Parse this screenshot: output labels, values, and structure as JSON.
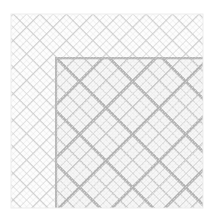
{
  "figure": {
    "title": "Recursive diagonal plaid pattern",
    "canvas_width": 215,
    "canvas_height": 219,
    "background_color": "#ffffff"
  },
  "chart_data": {
    "type": "heatmap",
    "title": "Recursive diagonal plaid pattern",
    "subtitle": "Self-similar 45-degree crosshatch with darker lower-right quadrant",
    "xlabel": "",
    "ylabel": "",
    "grid": false,
    "legend": "none",
    "plot_area": {
      "x": 11,
      "y": 14,
      "width": 192,
      "height": 194
    },
    "xlim": [
      11,
      203
    ],
    "ylim": [
      14,
      208
    ],
    "palette": {
      "background": "#ffffff",
      "base_fill": "#fdfdfd",
      "level1_line": "#9a9a9a",
      "level2_line": "#b4b4b4",
      "level3_line": "#c8c8c8",
      "level4_line": "#dcdcdc",
      "quadrant_tint": "#e2e2e2",
      "quadrant_border": "#b8b8b8",
      "band_color": "#b0b0b0"
    },
    "levels": [
      {
        "name": "level-1",
        "spacing": 37.5,
        "line_width": 5.4,
        "color": "#b0b0b0",
        "opacity": 0.95,
        "scope": "dark-quadrant"
      },
      {
        "name": "level-2",
        "spacing": 18.75,
        "line_width": 2.4,
        "color": "#bdbdbd",
        "opacity": 0.85,
        "scope": "full"
      },
      {
        "name": "level-3",
        "spacing": 9.4,
        "line_width": 1.3,
        "color": "#c9c9c9",
        "opacity": 0.8,
        "scope": "full"
      },
      {
        "name": "level-4",
        "spacing": 4.7,
        "line_width": 0.7,
        "color": "#d8d8d8",
        "opacity": 0.7,
        "scope": "full"
      }
    ],
    "dark_quadrant": {
      "x": 55,
      "y": 57,
      "width": 148,
      "height": 151,
      "tint_opacity": 0.22,
      "border_width": 2.2
    },
    "diagonal_angles_deg": [
      45,
      135
    ],
    "series": [
      {
        "name": "band-crossings-x",
        "values": [
          57,
          94,
          132,
          169,
          203
        ]
      },
      {
        "name": "band-crossings-y",
        "values": [
          59,
          96,
          134,
          171,
          208
        ]
      }
    ],
    "annotations": []
  }
}
